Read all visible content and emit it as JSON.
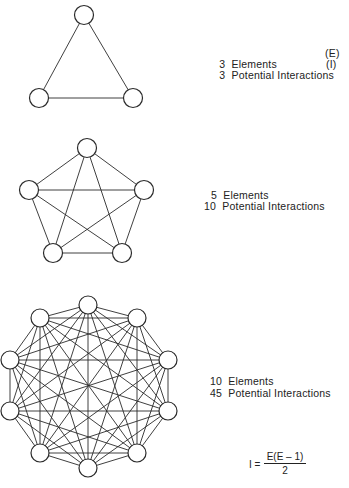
{
  "graphs": [
    {
      "id": "triangle",
      "elements": 3,
      "interactions": 3,
      "node_radius": 9.5,
      "nodes": [
        [
          84,
          15
        ],
        [
          39,
          98
        ],
        [
          133,
          98
        ]
      ],
      "label_elements": "3  Elements",
      "label_interactions": "3  Potential Interactions",
      "symbol_elements": "(E)",
      "symbol_interactions": "(I)"
    },
    {
      "id": "pentagon",
      "elements": 5,
      "interactions": 10,
      "node_radius": 9.5,
      "nodes": [
        [
          87,
          148
        ],
        [
          29,
          190
        ],
        [
          144,
          190
        ],
        [
          53,
          253
        ],
        [
          122,
          253
        ]
      ],
      "label_elements": "5  Elements",
      "label_interactions": "10  Potential Interactions"
    },
    {
      "id": "decagon",
      "elements": 10,
      "interactions": 45,
      "node_radius": 9,
      "nodes": [
        [
          88,
          305
        ],
        [
          137,
          318
        ],
        [
          168,
          360
        ],
        [
          168,
          411
        ],
        [
          137,
          453
        ],
        [
          88,
          468
        ],
        [
          40,
          453
        ],
        [
          10,
          411
        ],
        [
          10,
          360
        ],
        [
          40,
          318
        ]
      ],
      "label_elements": "10  Elements",
      "label_interactions": "45  Potential Interactions"
    }
  ],
  "formula": {
    "lhs": "I =",
    "numerator": "E(E – 1)",
    "denominator": "2"
  },
  "colors": {
    "line": "#2a2a2a",
    "text": "#222222",
    "background": "#ffffff"
  }
}
